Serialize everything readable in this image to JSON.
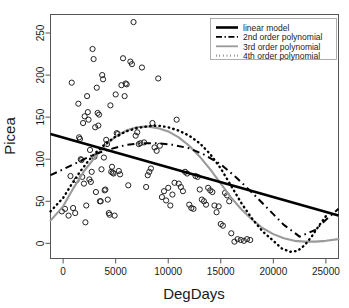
{
  "chart_data": {
    "type": "scatter",
    "title": "",
    "xlabel": "DegDays",
    "ylabel": "Picea",
    "xlim": [
      -1200,
      26200
    ],
    "ylim": [
      -18,
      272
    ],
    "xticks": [
      0,
      5000,
      10000,
      15000,
      20000,
      25000
    ],
    "yticks": [
      0,
      50,
      100,
      150,
      200,
      250
    ],
    "grid": false,
    "legend_position": "top-right",
    "marker": "open-circle",
    "legend": [
      {
        "label": "linear model",
        "style": "solid-thick",
        "color": "#000000"
      },
      {
        "label": "2nd order polynomial",
        "style": "dash-dot",
        "color": "#000000"
      },
      {
        "label": "3rd order polynomial",
        "style": "solid",
        "color": "#999999"
      },
      {
        "label": "4th order polynomial",
        "style": "dotted",
        "color": "#000000"
      }
    ],
    "points": [
      [
        -120,
        38
      ],
      [
        180,
        41
      ],
      [
        520,
        33
      ],
      [
        700,
        80
      ],
      [
        820,
        191
      ],
      [
        950,
        42
      ],
      [
        1150,
        36
      ],
      [
        1280,
        75
      ],
      [
        1450,
        166
      ],
      [
        1520,
        126
      ],
      [
        1600,
        124
      ],
      [
        1680,
        100
      ],
      [
        1750,
        99
      ],
      [
        1820,
        79
      ],
      [
        1900,
        143
      ],
      [
        1980,
        71
      ],
      [
        2050,
        151
      ],
      [
        2120,
        25
      ],
      [
        2200,
        45
      ],
      [
        2280,
        175
      ],
      [
        2350,
        156
      ],
      [
        2420,
        147
      ],
      [
        2500,
        76
      ],
      [
        2560,
        111
      ],
      [
        2640,
        73
      ],
      [
        2720,
        85
      ],
      [
        2800,
        231
      ],
      [
        2900,
        219
      ],
      [
        2980,
        103
      ],
      [
        3050,
        138
      ],
      [
        3120,
        61
      ],
      [
        3200,
        185
      ],
      [
        3280,
        155
      ],
      [
        3350,
        140
      ],
      [
        3420,
        153
      ],
      [
        3500,
        50
      ],
      [
        3580,
        50
      ],
      [
        3650,
        88
      ],
      [
        3720,
        200
      ],
      [
        3800,
        195
      ],
      [
        3880,
        102
      ],
      [
        3950,
        63
      ],
      [
        4020,
        64
      ],
      [
        4100,
        123
      ],
      [
        4180,
        118
      ],
      [
        4250,
        52
      ],
      [
        4350,
        36
      ],
      [
        4420,
        34
      ],
      [
        4500,
        164
      ],
      [
        4580,
        85
      ],
      [
        4650,
        91
      ],
      [
        4720,
        84
      ],
      [
        4800,
        83
      ],
      [
        4900,
        33
      ],
      [
        5000,
        177
      ],
      [
        5100,
        131
      ],
      [
        5200,
        130
      ],
      [
        5300,
        86
      ],
      [
        5420,
        82
      ],
      [
        5550,
        188
      ],
      [
        5700,
        220
      ],
      [
        5850,
        175
      ],
      [
        5950,
        190
      ],
      [
        6050,
        189
      ],
      [
        6200,
        69
      ],
      [
        6400,
        216
      ],
      [
        6550,
        213
      ],
      [
        6700,
        263
      ],
      [
        6900,
        128
      ],
      [
        7050,
        132
      ],
      [
        7200,
        118
      ],
      [
        7350,
        119
      ],
      [
        7500,
        209
      ],
      [
        7700,
        120
      ],
      [
        7900,
        67
      ],
      [
        8050,
        81
      ],
      [
        8200,
        85
      ],
      [
        8350,
        89
      ],
      [
        8500,
        143
      ],
      [
        8700,
        114
      ],
      [
        8900,
        110
      ],
      [
        9050,
        196
      ],
      [
        9200,
        116
      ],
      [
        9400,
        55
      ],
      [
        9600,
        62
      ],
      [
        9800,
        51
      ],
      [
        10000,
        66
      ],
      [
        10200,
        45
      ],
      [
        10400,
        58
      ],
      [
        10600,
        72
      ],
      [
        10800,
        147
      ],
      [
        11000,
        71
      ],
      [
        11200,
        67
      ],
      [
        11400,
        62
      ],
      [
        11600,
        85
      ],
      [
        11800,
        83
      ],
      [
        12000,
        46
      ],
      [
        12200,
        42
      ],
      [
        12400,
        41
      ],
      [
        12600,
        80
      ],
      [
        12800,
        79
      ],
      [
        13000,
        64
      ],
      [
        13200,
        52
      ],
      [
        13400,
        50
      ],
      [
        13600,
        46
      ],
      [
        13800,
        66
      ],
      [
        14000,
        63
      ],
      [
        14200,
        61
      ],
      [
        14400,
        45
      ],
      [
        14600,
        37
      ],
      [
        14800,
        44
      ],
      [
        15000,
        23
      ],
      [
        15200,
        21
      ],
      [
        15400,
        60
      ],
      [
        15600,
        57
      ],
      [
        15800,
        50
      ],
      [
        16000,
        12
      ],
      [
        16300,
        2
      ],
      [
        16600,
        5
      ],
      [
        16900,
        4
      ],
      [
        17200,
        3
      ],
      [
        17500,
        5
      ],
      [
        17800,
        4
      ]
    ],
    "curves": {
      "linear": [
        [
          -1200,
          130
        ],
        [
          26200,
          33
        ]
      ],
      "poly2": [
        [
          -1200,
          81
        ],
        [
          0,
          88
        ],
        [
          1500,
          97
        ],
        [
          3000,
          106
        ],
        [
          4500,
          112
        ],
        [
          6000,
          117
        ],
        [
          7500,
          119
        ],
        [
          9000,
          119
        ],
        [
          10500,
          117
        ],
        [
          12000,
          113
        ],
        [
          13500,
          105
        ],
        [
          15000,
          94
        ],
        [
          16500,
          78
        ],
        [
          18000,
          60
        ],
        [
          19500,
          41
        ],
        [
          21000,
          22
        ],
        [
          22500,
          8
        ],
        [
          24000,
          16
        ],
        [
          25000,
          28
        ],
        [
          26200,
          41
        ]
      ],
      "poly3": [
        [
          -1200,
          27
        ],
        [
          0,
          44
        ],
        [
          1000,
          66
        ],
        [
          2000,
          86
        ],
        [
          3000,
          102
        ],
        [
          4000,
          116
        ],
        [
          5000,
          127
        ],
        [
          6000,
          134
        ],
        [
          7000,
          138
        ],
        [
          8000,
          139
        ],
        [
          9000,
          137
        ],
        [
          10000,
          133
        ],
        [
          11000,
          126
        ],
        [
          12000,
          116
        ],
        [
          13000,
          103
        ],
        [
          14000,
          88
        ],
        [
          15000,
          71
        ],
        [
          16000,
          54
        ],
        [
          17000,
          40
        ],
        [
          18000,
          28
        ],
        [
          19000,
          18
        ],
        [
          20000,
          11
        ],
        [
          21000,
          6
        ],
        [
          22000,
          3
        ],
        [
          23000,
          2
        ],
        [
          24000,
          2
        ],
        [
          25000,
          3
        ],
        [
          26200,
          5
        ]
      ],
      "poly4": [
        [
          -1200,
          38
        ],
        [
          0,
          54
        ],
        [
          800,
          70
        ],
        [
          1600,
          85
        ],
        [
          2400,
          98
        ],
        [
          3200,
          109
        ],
        [
          4000,
          118
        ],
        [
          5000,
          127
        ],
        [
          6000,
          133
        ],
        [
          7000,
          137
        ],
        [
          8000,
          139
        ],
        [
          9000,
          140
        ],
        [
          10000,
          138
        ],
        [
          11000,
          134
        ],
        [
          12000,
          128
        ],
        [
          13000,
          119
        ],
        [
          14000,
          106
        ],
        [
          15000,
          89
        ],
        [
          16000,
          68
        ],
        [
          17000,
          47
        ],
        [
          18000,
          29
        ],
        [
          19000,
          14
        ],
        [
          20000,
          3
        ],
        [
          20800,
          -6
        ],
        [
          21600,
          -10
        ],
        [
          22300,
          -9
        ],
        [
          23000,
          -2
        ],
        [
          23700,
          9
        ],
        [
          24400,
          22
        ],
        [
          25100,
          34
        ]
      ]
    }
  }
}
